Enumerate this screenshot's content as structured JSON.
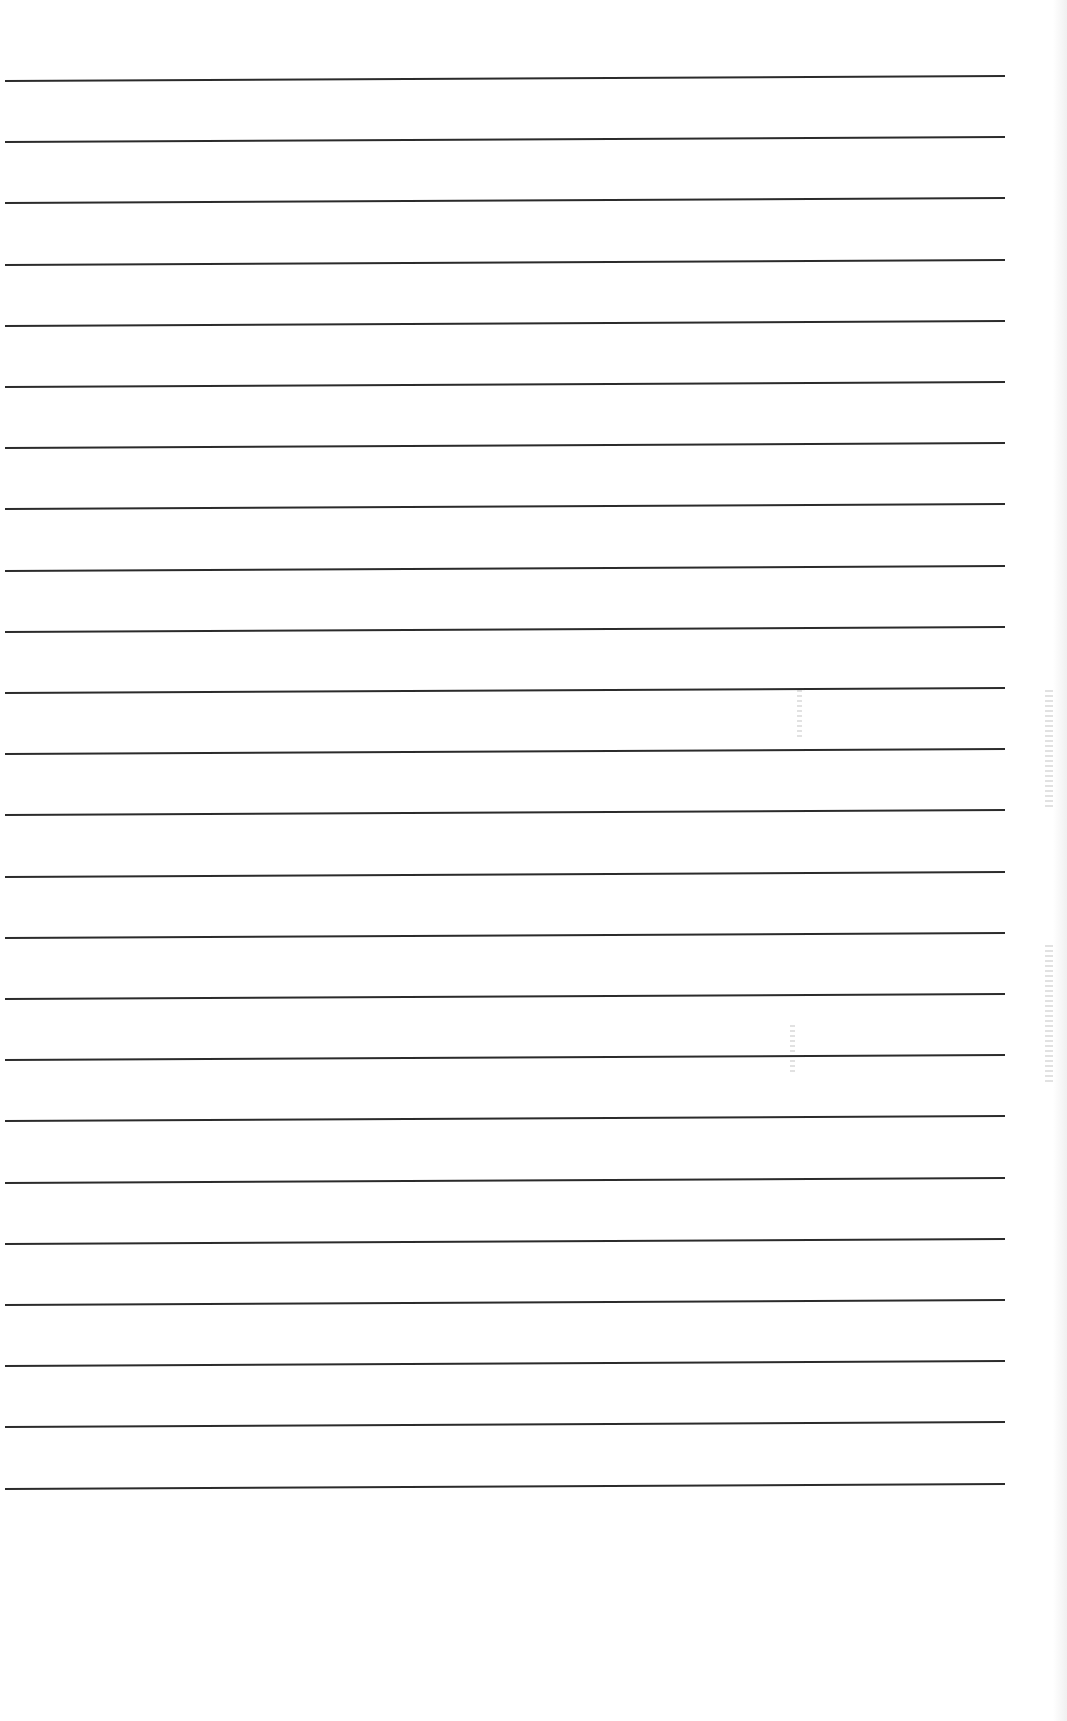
{
  "document": {
    "type": "blank-ruled-page",
    "ruled_line_count": 24,
    "line_spacing_px": 61,
    "first_line_y": 80,
    "line_color": "#2b2b2b",
    "background_color": "#ffffff",
    "text_content": []
  }
}
